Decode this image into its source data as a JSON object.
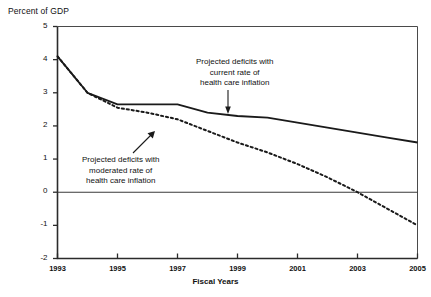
{
  "chart_data": {
    "type": "line",
    "title": "",
    "ylabel": "Percent of GDP",
    "xlabel": "Fiscal Years",
    "xlim": [
      1993,
      2005
    ],
    "ylim": [
      -2,
      5
    ],
    "grid": false,
    "legend_position": "none",
    "xticks": [
      1993,
      1995,
      1997,
      1999,
      2001,
      2003,
      2005
    ],
    "yticks": [
      5,
      4,
      3,
      2,
      1,
      0,
      -1,
      -2
    ],
    "xtick_labels": [
      "1993",
      "1995",
      "1997",
      "1999",
      "2001",
      "2003",
      "2005"
    ],
    "ytick_labels": [
      "5",
      "4",
      "3",
      "2",
      "1",
      "0",
      "-1",
      "-2"
    ],
    "zero_line": 0,
    "x": [
      1993,
      1994,
      1995,
      1996,
      1997,
      1998,
      1999,
      2000,
      2001,
      2002,
      2003,
      2004,
      2005
    ],
    "series": [
      {
        "name": "Projected deficits with current rate of health care inflation",
        "style": "solid",
        "color": "#1a1a1a",
        "values": [
          4.1,
          3.0,
          2.65,
          2.65,
          2.65,
          2.4,
          2.3,
          2.25,
          2.1,
          1.95,
          1.8,
          1.65,
          1.5
        ]
      },
      {
        "name": "Projected deficits with moderated rate of health care inflation",
        "style": "dashed",
        "color": "#1a1a1a",
        "values": [
          4.1,
          3.0,
          2.55,
          2.4,
          2.2,
          1.85,
          1.5,
          1.2,
          0.85,
          0.45,
          0.0,
          -0.5,
          -1.0
        ]
      }
    ],
    "annotations": [
      {
        "id": "upper",
        "lines": [
          "Projected deficits with",
          "current rate of",
          "health care inflation"
        ],
        "arrow": "down",
        "target_series": "Projected deficits with current rate of health care inflation"
      },
      {
        "id": "lower",
        "lines": [
          "Projected deficits with",
          "moderated rate of",
          "health care inflation"
        ],
        "arrow": "up-right",
        "target_series": "Projected deficits with moderated rate of health care inflation"
      }
    ]
  }
}
